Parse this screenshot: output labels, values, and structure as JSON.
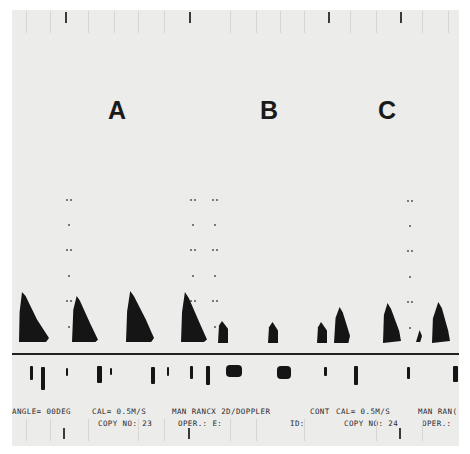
{
  "figure": {
    "panel_labels": [
      "A",
      "B",
      "C"
    ],
    "label_positions": [
      {
        "label": "A",
        "x": 96,
        "y": 86
      },
      {
        "label": "B",
        "x": 248,
        "y": 86
      },
      {
        "label": "C",
        "x": 366,
        "y": 86
      }
    ]
  },
  "printout": {
    "row1": [
      {
        "text": "ANGLE= 00DEG",
        "x": 0
      },
      {
        "text": "CAL= 0.5M/S",
        "x": 80
      },
      {
        "text": "MAN RANCX 2D/DOPPLER",
        "x": 160
      },
      {
        "text": "CONT",
        "x": 298
      },
      {
        "text": "CAL= 0.5M/S",
        "x": 324
      },
      {
        "text": "MAN RAN(",
        "x": 406
      }
    ],
    "row2": [
      {
        "text": "COPY NO: 23",
        "x": 86
      },
      {
        "text": "OPER.: E:",
        "x": 166
      },
      {
        "text": "ID:",
        "x": 278
      },
      {
        "text": "COPY NO: 24",
        "x": 332
      },
      {
        "text": "OPER.:",
        "x": 410
      }
    ]
  },
  "colors": {
    "paper": "#ececea",
    "ink": "#151515",
    "baseline": "#222222"
  }
}
